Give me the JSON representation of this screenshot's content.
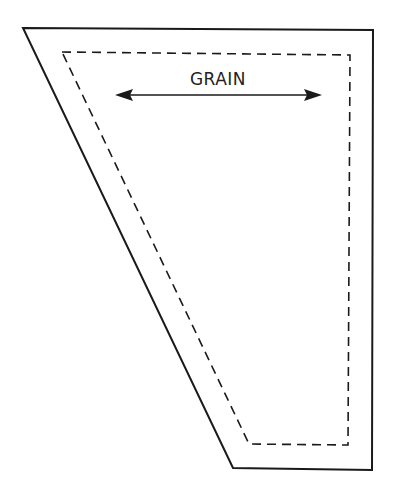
{
  "diagram": {
    "type": "pattern-piece",
    "grain_label": "GRAIN",
    "outer_outline": {
      "style": "solid",
      "points": [
        [
          23,
          28
        ],
        [
          373,
          30
        ],
        [
          372,
          470
        ],
        [
          233,
          468
        ]
      ]
    },
    "seam_line": {
      "style": "dashed",
      "points": [
        [
          62,
          52
        ],
        [
          350,
          55
        ],
        [
          348,
          445
        ],
        [
          249,
          444
        ]
      ]
    },
    "grain_arrow": {
      "x1": 115,
      "x2": 322,
      "y": 95,
      "direction": "both"
    },
    "colors": {
      "line": "#1a1a1a",
      "background": "#ffffff"
    }
  }
}
